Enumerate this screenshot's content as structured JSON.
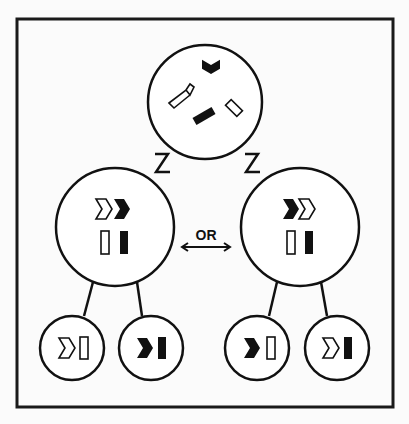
{
  "diagram": {
    "type": "binary-fission-style tree of chromosome-like pairs",
    "colors": {
      "ink": "#111111",
      "background": "#fbfbfb",
      "frame": "#1a1a1a"
    },
    "top_node": {
      "contents": [
        "black chevron",
        "white curved bar",
        "black bar",
        "white bar"
      ]
    },
    "middle_nodes": [
      {
        "position": "left",
        "contents": [
          "white chevron",
          "black chevron",
          "white bar",
          "black bar"
        ]
      },
      {
        "position": "right",
        "contents": [
          "black chevron",
          "white chevron",
          "white bar",
          "black bar"
        ]
      }
    ],
    "connector_label": "OR",
    "connector_icon": "double-arrow",
    "bottom_nodes": [
      {
        "parent": "left",
        "contents": [
          "white chevron",
          "white bar"
        ]
      },
      {
        "parent": "left",
        "contents": [
          "black chevron",
          "black bar"
        ]
      },
      {
        "parent": "right",
        "contents": [
          "black chevron",
          "white bar"
        ]
      },
      {
        "parent": "right",
        "contents": [
          "white chevron",
          "black bar"
        ]
      }
    ]
  }
}
